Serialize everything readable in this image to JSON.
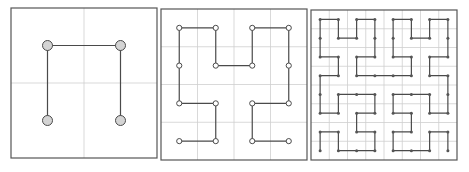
{
  "figure": {
    "colors": {
      "frame": "#555555",
      "grid": "#cfcfcf",
      "path": "#4a4a4a",
      "node_fill_large": "#d4d4d4",
      "node_fill_small": "#ffffff",
      "node_fill_dot": "#555555"
    },
    "panels": [
      {
        "name": "hilbert-order-1",
        "order": 1,
        "grid_cells": 2,
        "node_style": "large"
      },
      {
        "name": "hilbert-order-2",
        "order": 2,
        "grid_cells": 4,
        "node_style": "small"
      },
      {
        "name": "hilbert-order-3",
        "order": 3,
        "grid_cells": 8,
        "node_style": "dot"
      }
    ]
  }
}
